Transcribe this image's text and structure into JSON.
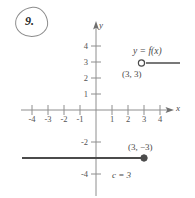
{
  "problem": {
    "number": "9.",
    "circled": true
  },
  "graph": {
    "axes": {
      "x_label": "x",
      "y_label": "y",
      "x_ticks": [
        "-4",
        "-3",
        "-2",
        "-1",
        "1",
        "2",
        "3",
        "4"
      ],
      "x_tick_values": [
        -4,
        -3,
        -2,
        -1,
        1,
        2,
        3,
        4
      ],
      "y_ticks": [
        "4",
        "3",
        "2",
        "1",
        "-2",
        "-4"
      ],
      "y_tick_values": [
        4,
        3,
        2,
        1,
        -2,
        -4
      ],
      "x_range": [
        -4.6,
        4.6
      ],
      "y_range": [
        -4.8,
        4.8
      ],
      "origin_label": ""
    },
    "function_label": "y = f(x)",
    "annotations": [
      {
        "name": "open-point-label",
        "text": "(3, 3)",
        "x": 3,
        "y": 3
      },
      {
        "name": "closed-point-label",
        "text": "(3, −3)",
        "x": 3,
        "y": -3
      },
      {
        "name": "c-value-label",
        "text": "c = 3"
      }
    ],
    "pieces": [
      {
        "name": "upper-ray",
        "y": 3,
        "x_start": 3,
        "x_end": 5.2,
        "endpoint": "open",
        "endpoint_x": 3,
        "endpoint_y": 3
      },
      {
        "name": "lower-ray",
        "y": -3,
        "x_start": -4.9,
        "x_end": 3,
        "endpoint": "closed",
        "endpoint_x": 3,
        "endpoint_y": -3
      }
    ],
    "colors": {
      "axis": "#8e8e8e",
      "curve": "#4b4b4b",
      "text": "#4a4a4a",
      "background": "#ffffff"
    }
  }
}
